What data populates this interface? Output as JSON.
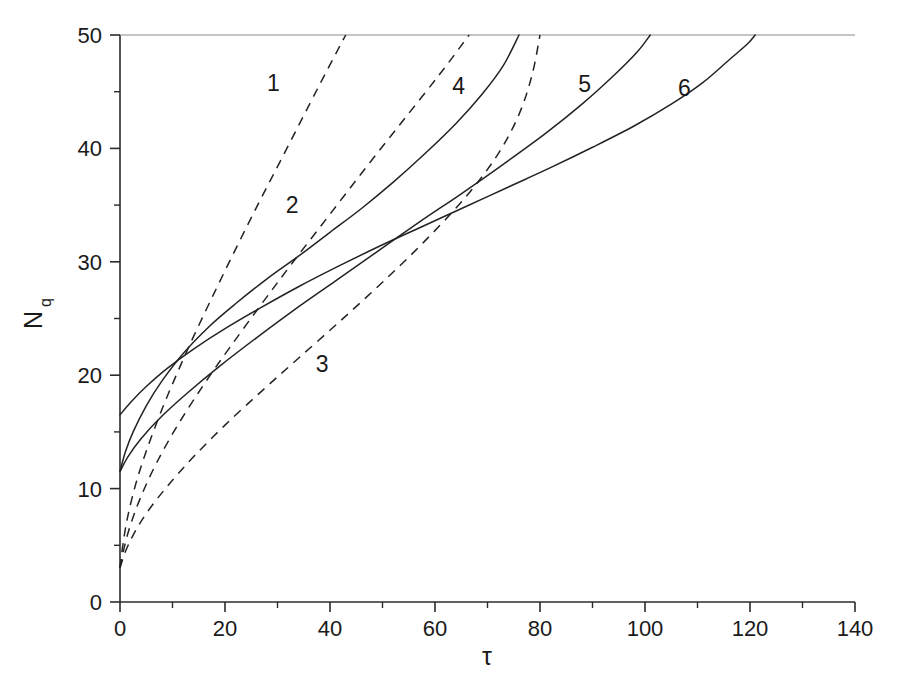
{
  "chart_data": {
    "type": "line",
    "title": "",
    "xlabel": "τ",
    "ylabel": "N",
    "ylabel_sub": "q",
    "xlim": [
      0,
      140
    ],
    "ylim": [
      0,
      50
    ],
    "xticks": [
      0,
      20,
      40,
      60,
      80,
      100,
      120,
      140
    ],
    "xtick_labels": [
      "0",
      "20",
      "40",
      "60",
      "80",
      "100",
      "120",
      "140"
    ],
    "xminor_step": 10,
    "yticks": [
      0,
      10,
      20,
      30,
      40,
      50
    ],
    "ytick_labels": [
      "0",
      "10",
      "20",
      "30",
      "40",
      "50"
    ],
    "yminor_step": 5,
    "grid": false,
    "legend_position": "inline-curve-labels",
    "series": [
      {
        "name": "1",
        "label": "1",
        "style": "dashed",
        "label_x": 29.2,
        "label_y": 45.8,
        "points": [
          [
            0,
            3.0
          ],
          [
            0.6,
            5.2
          ],
          [
            1.5,
            7.6
          ],
          [
            3.0,
            10.4
          ],
          [
            5.0,
            13.3
          ],
          [
            8.0,
            17.0
          ],
          [
            11.0,
            20.3
          ],
          [
            14.0,
            23.4
          ],
          [
            18.0,
            27.3
          ],
          [
            22.0,
            31.1
          ],
          [
            26.0,
            34.8
          ],
          [
            30.0,
            38.4
          ],
          [
            34.0,
            42.0
          ],
          [
            38.0,
            45.6
          ],
          [
            41.5,
            48.7
          ],
          [
            43.0,
            50.0
          ]
        ]
      },
      {
        "name": "2",
        "label": "2",
        "style": "dashed",
        "label_x": 32.8,
        "label_y": 35.0,
        "points": [
          [
            0,
            3.0
          ],
          [
            0.8,
            4.8
          ],
          [
            2.0,
            6.8
          ],
          [
            4.0,
            9.3
          ],
          [
            7.0,
            12.3
          ],
          [
            11.0,
            15.6
          ],
          [
            16.0,
            19.2
          ],
          [
            21.0,
            22.5
          ],
          [
            27.0,
            26.3
          ],
          [
            33.0,
            30.0
          ],
          [
            40.0,
            34.2
          ],
          [
            47.0,
            38.4
          ],
          [
            54.0,
            42.5
          ],
          [
            61.0,
            46.6
          ],
          [
            66.5,
            50.0
          ]
        ]
      },
      {
        "name": "3",
        "label": "3",
        "style": "dashed",
        "label_x": 38.5,
        "label_y": 21.0,
        "points": [
          [
            0,
            3.0
          ],
          [
            1.0,
            4.4
          ],
          [
            2.5,
            5.9
          ],
          [
            5.0,
            7.8
          ],
          [
            9.0,
            10.2
          ],
          [
            14.0,
            12.8
          ],
          [
            20.0,
            15.6
          ],
          [
            27.0,
            18.6
          ],
          [
            34.0,
            21.5
          ],
          [
            42.0,
            24.8
          ],
          [
            50.0,
            28.2
          ],
          [
            58.0,
            31.8
          ],
          [
            66.0,
            35.8
          ],
          [
            72.0,
            39.5
          ],
          [
            76.0,
            43.0
          ],
          [
            78.5,
            46.5
          ],
          [
            80.0,
            50.0
          ]
        ]
      },
      {
        "name": "4",
        "label": "4",
        "style": "solid",
        "label_x": 64.5,
        "label_y": 45.5,
        "points": [
          [
            0,
            11.5
          ],
          [
            1.0,
            13.2
          ],
          [
            2.5,
            15.0
          ],
          [
            5.0,
            17.3
          ],
          [
            8.0,
            19.5
          ],
          [
            12.0,
            21.9
          ],
          [
            17.0,
            24.3
          ],
          [
            22.0,
            26.3
          ],
          [
            28.0,
            28.5
          ],
          [
            34.0,
            30.5
          ],
          [
            40.0,
            32.6
          ],
          [
            46.0,
            34.7
          ],
          [
            52.0,
            37.0
          ],
          [
            58.0,
            39.5
          ],
          [
            64.0,
            42.2
          ],
          [
            69.0,
            44.8
          ],
          [
            73.0,
            47.3
          ],
          [
            76.0,
            50.0
          ]
        ]
      },
      {
        "name": "5",
        "label": "5",
        "style": "solid",
        "label_x": 88.5,
        "label_y": 45.7,
        "points": [
          [
            0,
            11.5
          ],
          [
            1.5,
            12.8
          ],
          [
            4.0,
            14.4
          ],
          [
            8.0,
            16.4
          ],
          [
            13.0,
            18.5
          ],
          [
            19.0,
            20.8
          ],
          [
            26.0,
            23.3
          ],
          [
            33.0,
            25.7
          ],
          [
            41.0,
            28.3
          ],
          [
            49.0,
            30.9
          ],
          [
            57.0,
            33.5
          ],
          [
            65.0,
            36.0
          ],
          [
            73.0,
            38.6
          ],
          [
            81.0,
            41.3
          ],
          [
            88.0,
            43.9
          ],
          [
            94.0,
            46.4
          ],
          [
            98.5,
            48.5
          ],
          [
            101.0,
            50.0
          ]
        ]
      },
      {
        "name": "6",
        "label": "6",
        "style": "solid",
        "label_x": 107.5,
        "label_y": 45.3,
        "points": [
          [
            0,
            16.5
          ],
          [
            2.0,
            17.6
          ],
          [
            5.0,
            19.0
          ],
          [
            9.0,
            20.6
          ],
          [
            14.0,
            22.3
          ],
          [
            20.0,
            24.1
          ],
          [
            27.0,
            26.0
          ],
          [
            34.0,
            27.8
          ],
          [
            42.0,
            29.7
          ],
          [
            50.0,
            31.5
          ],
          [
            58.0,
            33.2
          ],
          [
            66.0,
            34.9
          ],
          [
            74.0,
            36.6
          ],
          [
            82.0,
            38.3
          ],
          [
            90.0,
            40.1
          ],
          [
            98.0,
            42.0
          ],
          [
            105.0,
            43.9
          ],
          [
            111.0,
            45.8
          ],
          [
            116.0,
            47.8
          ],
          [
            119.5,
            49.2
          ],
          [
            121.0,
            50.0
          ]
        ]
      }
    ]
  }
}
